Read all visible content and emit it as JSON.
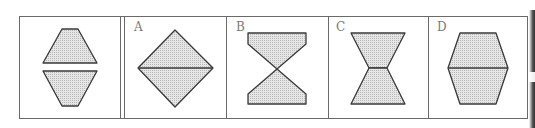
{
  "puzzle": {
    "question_panel": {
      "figure": "two-trapezoids-separated-horizontally"
    },
    "options": [
      {
        "label": "A",
        "figure": "diamond-split-by-horizontal-line"
      },
      {
        "label": "B",
        "figure": "hourglass-two-trapezoids-meeting-at-point"
      },
      {
        "label": "C",
        "figure": "hourglass-two-trapezoids-joined-by-short-edge"
      },
      {
        "label": "D",
        "figure": "hexagon-split-by-horizontal-line"
      }
    ]
  },
  "colors": {
    "stroke": "#3a3a3a",
    "fill": "#dcdcdc",
    "border": "#6a6a6a",
    "label": "#7a7a7a"
  }
}
